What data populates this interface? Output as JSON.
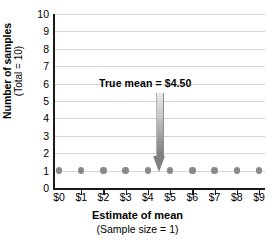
{
  "chart_data": {
    "type": "scatter",
    "title": "",
    "xlabel": "Estimate of mean",
    "xlabel_sub": "(Sample size = 1)",
    "ylabel": "Number of samples",
    "ylabel_sub": "(Total = 10)",
    "categories": [
      "$0",
      "$1",
      "$2",
      "$3",
      "$4",
      "$5",
      "$6",
      "$7",
      "$8",
      "$9"
    ],
    "x": [
      0,
      1,
      2,
      3,
      4,
      5,
      6,
      7,
      8,
      9
    ],
    "values": [
      1,
      1,
      1,
      1,
      1,
      1,
      1,
      1,
      1,
      1
    ],
    "xlim": [
      0,
      9
    ],
    "ylim": [
      0,
      10
    ],
    "ytick_labels": [
      "10",
      "9",
      "8",
      "7",
      "6",
      "5",
      "4",
      "3",
      "2",
      "1",
      "0"
    ],
    "ytick_values": [
      10,
      9,
      8,
      7,
      6,
      5,
      4,
      3,
      2,
      1,
      0
    ],
    "grid": true,
    "grid_axis": "y",
    "legend": false,
    "annotations": [
      {
        "label": "True mean  =  $4.50",
        "value": 4.5,
        "arrow": "down-arrow",
        "points_to_x": "$4.50",
        "points_to_y": 1
      }
    ],
    "colors": {
      "point": "#8a8a8a",
      "gridline": "#d6d6d6",
      "axis": "#1a1a1a",
      "arrow": "#808080",
      "text": "#000000",
      "background": "#ffffff"
    }
  }
}
